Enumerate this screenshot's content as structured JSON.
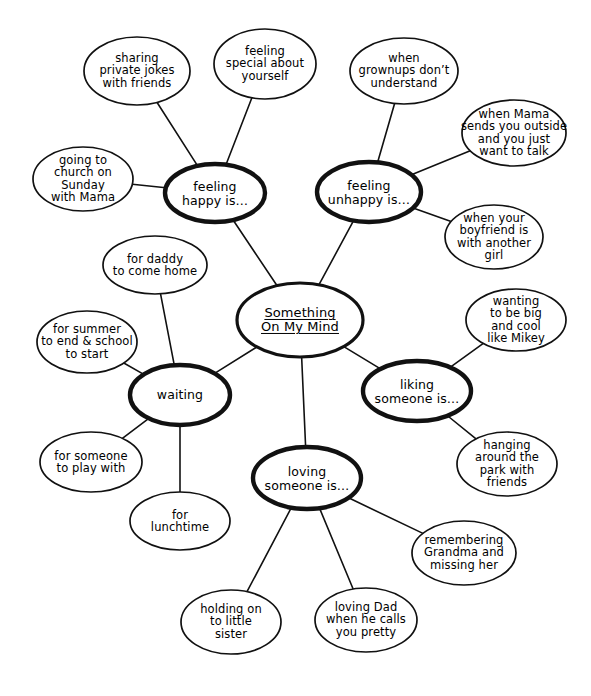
{
  "diagram": {
    "title": "Something On My Mind",
    "type": "mind-map",
    "style": "hand-drawn",
    "colors": {
      "ink": "#111111",
      "background": "#ffffff"
    },
    "center": {
      "id": "center",
      "label": "Something\nOn My Mind",
      "cx": 300,
      "cy": 320,
      "rx": 63,
      "ry": 37,
      "rank": "center"
    },
    "nodes": [
      {
        "id": "feeling-happy",
        "label": "feeling\nhappy is…",
        "cx": 215,
        "cy": 193,
        "rx": 50,
        "ry": 29,
        "rank": "primary"
      },
      {
        "id": "feeling-unhappy",
        "label": "feeling\nunhappy is…",
        "cx": 369,
        "cy": 192,
        "rx": 52,
        "ry": 30,
        "rank": "primary"
      },
      {
        "id": "waiting",
        "label": "waiting",
        "cx": 180,
        "cy": 395,
        "rx": 50,
        "ry": 30,
        "rank": "primary"
      },
      {
        "id": "liking-someone",
        "label": "liking\nsomeone is…",
        "cx": 417,
        "cy": 391,
        "rx": 54,
        "ry": 30,
        "rank": "primary"
      },
      {
        "id": "loving-someone",
        "label": "loving\nsomeone is…",
        "cx": 307,
        "cy": 478,
        "rx": 54,
        "ry": 31,
        "rank": "primary"
      },
      {
        "id": "sharing-private-jokes",
        "label": "sharing\nprivate jokes\nwith friends",
        "cx": 137,
        "cy": 71,
        "rx": 53,
        "ry": 34,
        "rank": "leaf"
      },
      {
        "id": "feeling-special",
        "label": "feeling\nspecial about\nyourself",
        "cx": 265,
        "cy": 64,
        "rx": 51,
        "ry": 35,
        "rank": "leaf"
      },
      {
        "id": "going-to-church",
        "label": "going to\nchurch on\nSunday\nwith Mama",
        "cx": 83,
        "cy": 179,
        "rx": 50,
        "ry": 32,
        "rank": "leaf"
      },
      {
        "id": "when-grownups",
        "label": "when\ngrownups don’t\nunderstand",
        "cx": 404,
        "cy": 71,
        "rx": 54,
        "ry": 33,
        "rank": "leaf"
      },
      {
        "id": "when-mama-sends",
        "label": "when Mama\nsends you outside\nand  you just\nwant to talk",
        "cx": 514,
        "cy": 133,
        "rx": 52,
        "ry": 33,
        "rank": "leaf"
      },
      {
        "id": "when-boyfriend",
        "label": "when your\nboyfriend is\nwith another\ngirl",
        "cx": 494,
        "cy": 237,
        "rx": 49,
        "ry": 32,
        "rank": "leaf"
      },
      {
        "id": "for-daddy",
        "label": "for daddy\nto come home",
        "cx": 155,
        "cy": 265,
        "rx": 52,
        "ry": 29,
        "rank": "leaf"
      },
      {
        "id": "for-summer",
        "label": "for summer\nto end & school\nto  start",
        "cx": 87,
        "cy": 342,
        "rx": 50,
        "ry": 31,
        "rank": "leaf"
      },
      {
        "id": "for-someone-to-play",
        "label": "for someone\nto play with",
        "cx": 91,
        "cy": 462,
        "rx": 51,
        "ry": 30,
        "rank": "leaf"
      },
      {
        "id": "for-lunchtime",
        "label": "for\nlunchtime",
        "cx": 180,
        "cy": 521,
        "rx": 50,
        "ry": 29,
        "rank": "leaf"
      },
      {
        "id": "wanting-to-be-big",
        "label": "wanting\nto be big\nand cool\nlike Mikey",
        "cx": 516,
        "cy": 320,
        "rx": 50,
        "ry": 31,
        "rank": "leaf"
      },
      {
        "id": "hanging-around-park",
        "label": "hanging\naround the\npark with\nfriends",
        "cx": 507,
        "cy": 464,
        "rx": 50,
        "ry": 32,
        "rank": "leaf"
      },
      {
        "id": "remembering-grandma",
        "label": "remembering\nGrandma and\nmissing her",
        "cx": 464,
        "cy": 553,
        "rx": 52,
        "ry": 32,
        "rank": "leaf"
      },
      {
        "id": "holding-on-sister",
        "label": "holding on\nto little\nsister",
        "cx": 231,
        "cy": 622,
        "rx": 50,
        "ry": 32,
        "rank": "leaf"
      },
      {
        "id": "loving-dad",
        "label": "loving Dad\nwhen he calls\nyou pretty",
        "cx": 366,
        "cy": 620,
        "rx": 51,
        "ry": 32,
        "rank": "leaf"
      }
    ],
    "edges": [
      {
        "from": "center",
        "to": "feeling-happy"
      },
      {
        "from": "center",
        "to": "feeling-unhappy"
      },
      {
        "from": "center",
        "to": "waiting"
      },
      {
        "from": "center",
        "to": "liking-someone"
      },
      {
        "from": "center",
        "to": "loving-someone"
      },
      {
        "from": "feeling-happy",
        "to": "sharing-private-jokes"
      },
      {
        "from": "feeling-happy",
        "to": "feeling-special"
      },
      {
        "from": "feeling-happy",
        "to": "going-to-church"
      },
      {
        "from": "feeling-unhappy",
        "to": "when-grownups"
      },
      {
        "from": "feeling-unhappy",
        "to": "when-mama-sends"
      },
      {
        "from": "feeling-unhappy",
        "to": "when-boyfriend"
      },
      {
        "from": "waiting",
        "to": "for-daddy"
      },
      {
        "from": "waiting",
        "to": "for-summer"
      },
      {
        "from": "waiting",
        "to": "for-someone-to-play"
      },
      {
        "from": "waiting",
        "to": "for-lunchtime"
      },
      {
        "from": "liking-someone",
        "to": "wanting-to-be-big"
      },
      {
        "from": "liking-someone",
        "to": "hanging-around-park"
      },
      {
        "from": "loving-someone",
        "to": "remembering-grandma"
      },
      {
        "from": "loving-someone",
        "to": "holding-on-sister"
      },
      {
        "from": "loving-someone",
        "to": "loving-dad"
      }
    ]
  }
}
